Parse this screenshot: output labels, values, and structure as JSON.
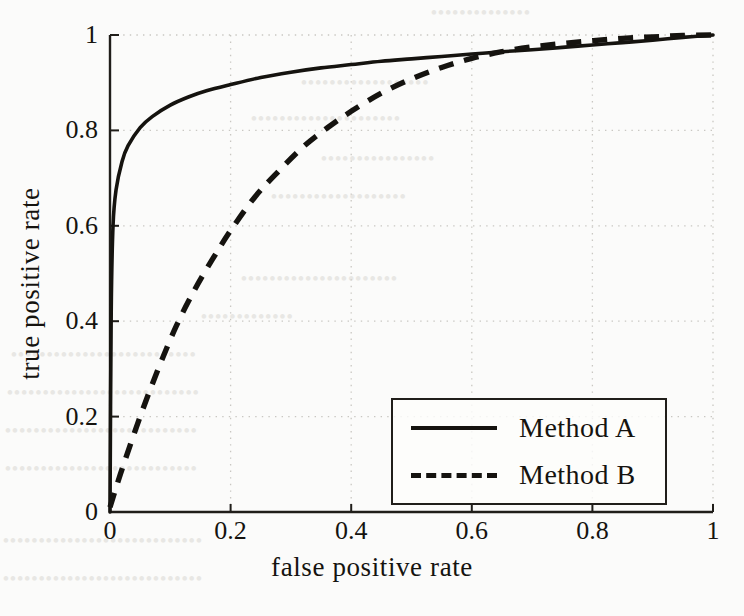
{
  "figure": {
    "background_color": "#fbfbfa",
    "ink_color": "#15130f",
    "grid_color": "#c9c7c2"
  },
  "chart_data": {
    "type": "line",
    "title": "",
    "xlabel": "false positive rate",
    "ylabel": "true  positive rate",
    "xlim": [
      0,
      1
    ],
    "ylim": [
      0,
      1
    ],
    "xticks": [
      "0",
      "0.2",
      "0.4",
      "0.6",
      "0.8",
      "1"
    ],
    "yticks": [
      "0",
      "0.2",
      "0.4",
      "0.6",
      "0.8",
      "1"
    ],
    "xtick_values": [
      0,
      0.2,
      0.4,
      0.6,
      0.8,
      1
    ],
    "ytick_values": [
      0,
      0.2,
      0.4,
      0.6,
      0.8,
      1
    ],
    "grid": true,
    "grid_style": "dotted",
    "legend_position": "lower right",
    "series": [
      {
        "name": "Method A",
        "style": "solid",
        "color": "#15130f",
        "x": [
          0,
          0.002,
          0.005,
          0.01,
          0.02,
          0.03,
          0.05,
          0.07,
          0.1,
          0.13,
          0.16,
          0.2,
          0.25,
          0.3,
          0.35,
          0.4,
          0.45,
          0.5,
          0.55,
          0.6,
          0.65,
          0.7,
          0.75,
          0.8,
          0.85,
          0.9,
          0.95,
          1
        ],
        "y": [
          0,
          0.42,
          0.6,
          0.675,
          0.735,
          0.768,
          0.806,
          0.829,
          0.853,
          0.87,
          0.883,
          0.896,
          0.911,
          0.922,
          0.931,
          0.938,
          0.945,
          0.95,
          0.955,
          0.96,
          0.965,
          0.969,
          0.974,
          0.979,
          0.984,
          0.989,
          0.995,
          1
        ]
      },
      {
        "name": "Method B",
        "style": "dashed",
        "color": "#15130f",
        "x": [
          0,
          0.02,
          0.05,
          0.08,
          0.11,
          0.14,
          0.17,
          0.2,
          0.24,
          0.28,
          0.32,
          0.36,
          0.4,
          0.45,
          0.5,
          0.55,
          0.6,
          0.65,
          0.7,
          0.75,
          0.8,
          0.85,
          0.9,
          0.95,
          1
        ],
        "y": [
          0.01,
          0.09,
          0.2,
          0.3,
          0.39,
          0.465,
          0.53,
          0.59,
          0.66,
          0.715,
          0.765,
          0.805,
          0.84,
          0.878,
          0.908,
          0.932,
          0.951,
          0.965,
          0.975,
          0.982,
          0.988,
          0.993,
          0.996,
          0.999,
          1
        ]
      }
    ],
    "annotations": []
  },
  "legend": {
    "entries": [
      {
        "label": "Method A",
        "style": "solid"
      },
      {
        "label": "Method B",
        "style": "dashed"
      }
    ]
  },
  "bleed_through": {
    "visible": true,
    "note": "faint mirrored text from the reverse page of the scan"
  }
}
